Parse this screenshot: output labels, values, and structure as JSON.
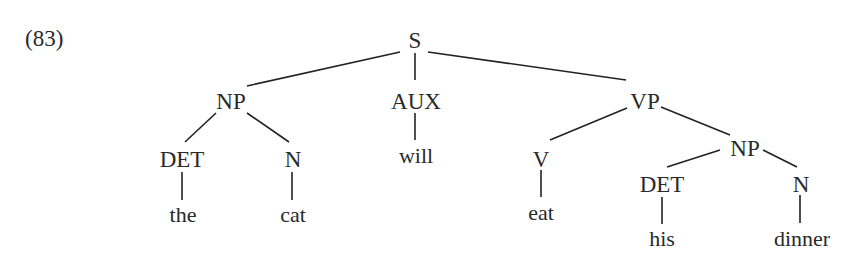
{
  "example_label": "(83)",
  "tree": {
    "nodes": {
      "S": "S",
      "NP1": "NP",
      "AUX": "AUX",
      "VP": "VP",
      "DET1": "DET",
      "N1": "N",
      "V": "V",
      "NP2": "NP",
      "DET2": "DET",
      "N2": "N"
    },
    "leaves": {
      "the": "the",
      "cat": "cat",
      "will": "will",
      "eat": "eat",
      "his": "his",
      "dinner": "dinner"
    },
    "structure": "[S [NP [DET the] [N cat]] [AUX will] [VP [V eat] [NP [DET his] [N dinner]]]]"
  }
}
